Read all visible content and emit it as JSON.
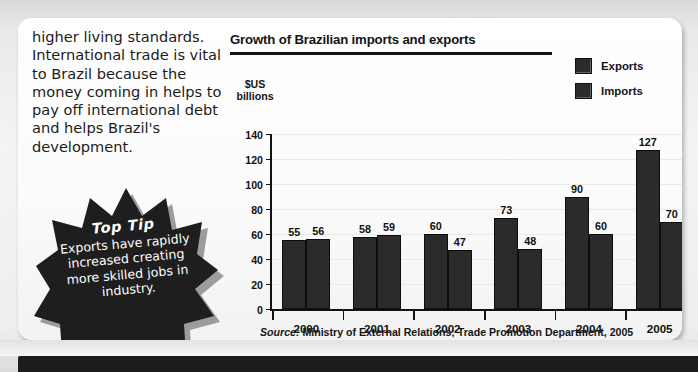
{
  "body_copy": {
    "paragraph": "higher living standards. International trade is vital to Brazil because the money coming in helps to pay off international debt and helps Brazil's development."
  },
  "top_tip": {
    "heading": "Top Tip",
    "body": "Exports have rapidly increased creating more skilled jobs in industry."
  },
  "chart": {
    "title": "Growth of Brazilian imports and exports",
    "y_axis_caption_line1": "$US",
    "y_axis_caption_line2": "billions",
    "source_prefix": "Source:",
    "source_text": "Ministry of External Relations; Trade Promotion Department, 2005",
    "legend": [
      {
        "label": "Exports",
        "color": "#2b2b2b"
      },
      {
        "label": "Imports",
        "color": "#2b2b2b"
      }
    ]
  },
  "chart_data": {
    "type": "bar",
    "title": "Growth of Brazilian imports and exports",
    "xlabel": "",
    "ylabel": "$US billions",
    "ylim": [
      0,
      140
    ],
    "yticks": [
      0,
      20,
      40,
      60,
      80,
      100,
      120,
      140
    ],
    "grid": true,
    "legend_position": "top-right",
    "categories": [
      "2000",
      "2001",
      "2002",
      "2003",
      "2004",
      "2005"
    ],
    "series": [
      {
        "name": "Exports",
        "values": [
          55,
          58,
          60,
          73,
          90,
          127
        ]
      },
      {
        "name": "Imports",
        "values": [
          56,
          59,
          47,
          48,
          60,
          70
        ]
      }
    ],
    "source": "Source: Ministry of External Relations; Trade Promotion Department, 2005"
  },
  "bleed_through": {
    "politics": "Politics",
    "government": "nal Government",
    "grey_a": "Local and regional",
    "grey_b": "national government",
    "grey_c": "cial"
  }
}
